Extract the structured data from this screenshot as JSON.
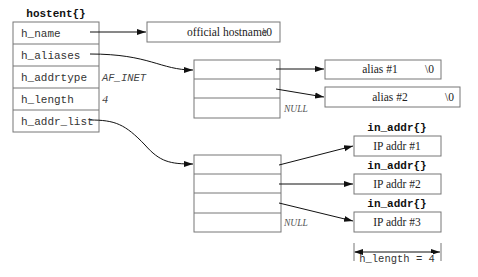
{
  "hostent": {
    "title": "hostent{}",
    "fields": [
      {
        "name": "h_name",
        "value": ""
      },
      {
        "name": "h_aliases",
        "value": ""
      },
      {
        "name": "h_addrtype",
        "value": "AF_INET"
      },
      {
        "name": "h_length",
        "value": "4"
      },
      {
        "name": "h_addr_list",
        "value": ""
      }
    ]
  },
  "official_hostname": {
    "label": "official hostname",
    "terminator": "\\0"
  },
  "aliases_array": {
    "null_label": "NULL"
  },
  "aliases": [
    {
      "label": "alias #1",
      "terminator": "\\0"
    },
    {
      "label": "alias #2",
      "terminator": "\\0"
    }
  ],
  "addr_array": {
    "null_label": "NULL"
  },
  "addresses": [
    {
      "struct": "in_addr{}",
      "label": "IP addr #1"
    },
    {
      "struct": "in_addr{}",
      "label": "IP addr #2"
    },
    {
      "struct": "in_addr{}",
      "label": "IP addr #3"
    }
  ],
  "dimension": {
    "label": "h_length = 4"
  }
}
